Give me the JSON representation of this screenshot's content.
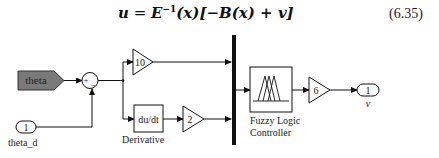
{
  "equation": {
    "lhs": "u",
    "eq": " = ",
    "E": "E",
    "inv": "−1",
    "rest": "(x)[−B(x) + v]",
    "number": "(6.35)"
  },
  "blocks": {
    "from_tag": {
      "label": "theta",
      "fill": "#7a7a7a"
    },
    "sum": {
      "plus": "+",
      "minus": "−"
    },
    "inport": {
      "number": "1",
      "label": "theta_d"
    },
    "gain_p": {
      "value": "10"
    },
    "derivative": {
      "text": "du/dt",
      "label": "Derivative"
    },
    "gain_d": {
      "value": "2"
    },
    "fuzzy": {
      "label_line1": "Fuzzy Logic",
      "label_line2": "Controller"
    },
    "gain_out": {
      "value": "6"
    },
    "outport": {
      "number": "1",
      "label": "v"
    }
  }
}
